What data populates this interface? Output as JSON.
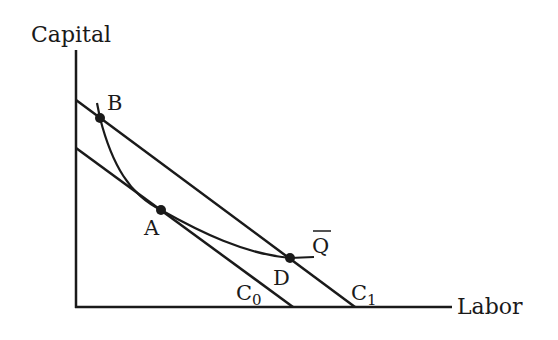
{
  "diagram": {
    "type": "isoquant-isocost",
    "axes": {
      "y_label": "Capital",
      "x_label": "Labor"
    },
    "isocost_lines": [
      {
        "name": "C0",
        "base": "C",
        "subscript": "0"
      },
      {
        "name": "C1",
        "base": "C",
        "subscript": "1"
      }
    ],
    "isoquant": {
      "label": "Q",
      "overbar": true
    },
    "points": [
      {
        "label": "A"
      },
      {
        "label": "B"
      },
      {
        "label": "D"
      }
    ],
    "colors": {
      "ink": "#1a1a1a",
      "background": "#ffffff"
    }
  }
}
